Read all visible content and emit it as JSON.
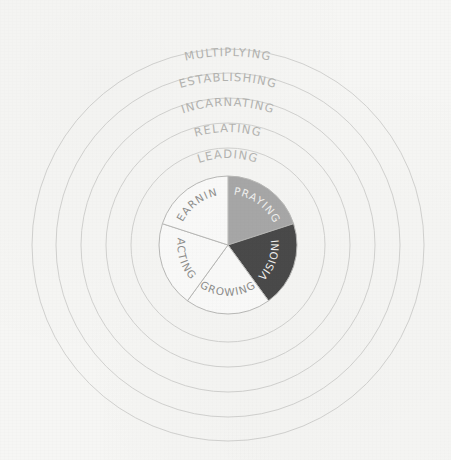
{
  "diagram": {
    "background_color": "#f6f6f4",
    "center": {
      "x": 228,
      "y": 245
    },
    "rings": [
      {
        "label": "LEADING",
        "radius": 97,
        "stroke": "#d2d2d0",
        "label_y": 162
      },
      {
        "label": "RELATING",
        "radius": 122,
        "stroke": "#d2d2d0",
        "label_y": 136
      },
      {
        "label": "INCARNATING",
        "radius": 147,
        "stroke": "#d2d2d0",
        "label_y": 110
      },
      {
        "label": "ESTABLISHING",
        "radius": 172,
        "stroke": "#d2d2d0",
        "label_y": 85
      },
      {
        "label": "MULTIPLYING",
        "radius": 196,
        "stroke": "#d2d2d0",
        "label_y": 60
      }
    ]
  },
  "chart_data": {
    "type": "pie",
    "radius": 69,
    "categories": [
      "PRAYING",
      "ENVISIONING",
      "GROWING",
      "ACTING",
      "LEARNING"
    ],
    "values": [
      20,
      20,
      20,
      20,
      20
    ],
    "colors": [
      "#a8a8a8",
      "#4a4a4a",
      "#fbfbfa",
      "#fbfbfa",
      "#fbfbfa"
    ],
    "label_colors": [
      "#f2f2f0",
      "#f2f2f0",
      "#8e8e8c",
      "#8e8e8c",
      "#8e8e8c"
    ],
    "slice_stroke": "#b9b9b7",
    "start_angle_deg": 0,
    "legend": "none",
    "grid": false,
    "outer_rings": [
      "LEADING",
      "RELATING",
      "INCARNATING",
      "ESTABLISHING",
      "MULTIPLYING"
    ],
    "slices": [
      {
        "label": "PRAYING",
        "value": 20,
        "color": "#a8a8a8",
        "label_color": "#f2f2f0",
        "mid_angle_deg": 36
      },
      {
        "label": "ENVISIONING",
        "value": 20,
        "color": "#4a4a4a",
        "label_color": "#f2f2f0",
        "mid_angle_deg": 108
      },
      {
        "label": "GROWING",
        "value": 20,
        "color": "#fbfbfa",
        "label_color": "#8e8e8c",
        "mid_angle_deg": 180
      },
      {
        "label": "ACTING",
        "value": 20,
        "color": "#fbfbfa",
        "label_color": "#8e8e8c",
        "mid_angle_deg": 252
      },
      {
        "label": "LEARNING",
        "value": 20,
        "color": "#fbfbfa",
        "label_color": "#8e8e8c",
        "mid_angle_deg": 324
      }
    ]
  }
}
